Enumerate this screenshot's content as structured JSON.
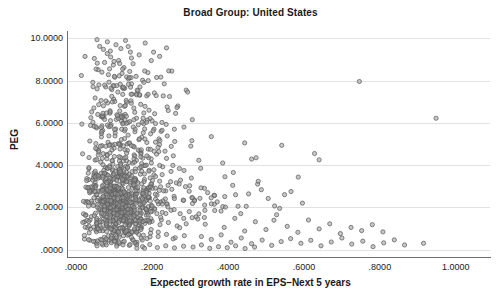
{
  "chart_data": {
    "type": "scatter",
    "title": "Broad Group: United States",
    "xlabel": "Expected growth rate in EPS–Next 5 years",
    "ylabel": "PEG",
    "xlim": [
      -0.024,
      1.09
    ],
    "ylim": [
      -0.35,
      10.35
    ],
    "xticks": [
      0.0,
      0.2,
      0.4,
      0.6,
      0.8,
      1.0
    ],
    "xtick_labels": [
      ".0000",
      ".2000",
      ".4000",
      ".6000",
      ".8000",
      "1.0000"
    ],
    "yticks": [
      0.0,
      2.0,
      4.0,
      6.0,
      8.0,
      10.0
    ],
    "ytick_labels": [
      ".0000",
      "2.0000",
      "4.0000",
      "6.0000",
      "8.0000",
      "10.0000"
    ],
    "grid": "horizontal",
    "legend": null,
    "marker": {
      "shape": "circle",
      "size": 4.2,
      "fill": "#9a9a9a",
      "edge": "#5d5d5d",
      "opacity": 0.55
    },
    "n_points": 1180,
    "points": [
      [
        0.055,
        9.94
      ],
      [
        0.062,
        9.62
      ],
      [
        0.072,
        9.48
      ],
      [
        0.105,
        9.7
      ],
      [
        0.118,
        9.52
      ],
      [
        0.13,
        9.9
      ],
      [
        0.082,
        9.28
      ],
      [
        0.091,
        9.12
      ],
      [
        0.143,
        9.35
      ],
      [
        0.166,
        9.22
      ],
      [
        0.048,
        9.05
      ],
      [
        0.075,
        8.86
      ],
      [
        0.098,
        8.74
      ],
      [
        0.112,
        8.95
      ],
      [
        0.126,
        8.62
      ],
      [
        0.15,
        8.8
      ],
      [
        0.058,
        8.52
      ],
      [
        0.068,
        8.4
      ],
      [
        0.085,
        8.28
      ],
      [
        0.102,
        8.16
      ],
      [
        0.121,
        8.34
      ],
      [
        0.138,
        8.08
      ],
      [
        0.158,
        8.2
      ],
      [
        0.175,
        8.02
      ],
      [
        0.044,
        7.92
      ],
      [
        0.06,
        7.8
      ],
      [
        0.078,
        7.7
      ],
      [
        0.094,
        7.58
      ],
      [
        0.11,
        7.46
      ],
      [
        0.128,
        7.64
      ],
      [
        0.147,
        7.36
      ],
      [
        0.163,
        7.52
      ],
      [
        0.186,
        7.28
      ],
      [
        0.05,
        7.18
      ],
      [
        0.066,
        7.06
      ],
      [
        0.083,
        6.94
      ],
      [
        0.099,
        7.12
      ],
      [
        0.116,
        6.82
      ],
      [
        0.133,
        6.98
      ],
      [
        0.152,
        6.7
      ],
      [
        0.17,
        6.88
      ],
      [
        0.192,
        6.6
      ],
      [
        0.041,
        6.52
      ],
      [
        0.057,
        6.4
      ],
      [
        0.073,
        6.28
      ],
      [
        0.089,
        6.46
      ],
      [
        0.106,
        6.16
      ],
      [
        0.123,
        6.34
      ],
      [
        0.141,
        6.06
      ],
      [
        0.159,
        6.22
      ],
      [
        0.178,
        5.96
      ],
      [
        0.2,
        6.1
      ],
      [
        0.226,
        6.02
      ],
      [
        0.038,
        5.88
      ],
      [
        0.054,
        5.76
      ],
      [
        0.07,
        5.64
      ],
      [
        0.086,
        5.82
      ],
      [
        0.103,
        5.52
      ],
      [
        0.12,
        5.7
      ],
      [
        0.137,
        5.42
      ],
      [
        0.155,
        5.58
      ],
      [
        0.173,
        5.32
      ],
      [
        0.196,
        5.48
      ],
      [
        0.218,
        5.24
      ],
      [
        0.24,
        5.38
      ],
      [
        0.036,
        5.14
      ],
      [
        0.052,
        5.02
      ],
      [
        0.068,
        4.92
      ],
      [
        0.084,
        5.08
      ],
      [
        0.1,
        4.8
      ],
      [
        0.117,
        4.96
      ],
      [
        0.135,
        4.7
      ],
      [
        0.153,
        4.86
      ],
      [
        0.171,
        4.6
      ],
      [
        0.19,
        4.76
      ],
      [
        0.212,
        4.52
      ],
      [
        0.234,
        4.66
      ],
      [
        0.256,
        4.44
      ],
      [
        0.034,
        4.36
      ],
      [
        0.05,
        4.24
      ],
      [
        0.065,
        4.14
      ],
      [
        0.081,
        4.3
      ],
      [
        0.097,
        4.04
      ],
      [
        0.114,
        4.2
      ],
      [
        0.131,
        3.94
      ],
      [
        0.149,
        4.1
      ],
      [
        0.167,
        3.86
      ],
      [
        0.185,
        4.0
      ],
      [
        0.205,
        3.78
      ],
      [
        0.228,
        3.92
      ],
      [
        0.25,
        3.7
      ],
      [
        0.272,
        3.84
      ],
      [
        0.032,
        3.62
      ],
      [
        0.047,
        3.52
      ],
      [
        0.062,
        3.42
      ],
      [
        0.078,
        3.58
      ],
      [
        0.094,
        3.34
      ],
      [
        0.11,
        3.48
      ],
      [
        0.127,
        3.26
      ],
      [
        0.144,
        3.4
      ],
      [
        0.162,
        3.18
      ],
      [
        0.18,
        3.32
      ],
      [
        0.199,
        3.1
      ],
      [
        0.22,
        3.24
      ],
      [
        0.242,
        3.04
      ],
      [
        0.264,
        3.16
      ],
      [
        0.288,
        2.98
      ],
      [
        0.03,
        2.92
      ],
      [
        0.044,
        2.84
      ],
      [
        0.059,
        2.76
      ],
      [
        0.074,
        2.88
      ],
      [
        0.09,
        2.68
      ],
      [
        0.106,
        2.8
      ],
      [
        0.122,
        2.6
      ],
      [
        0.139,
        2.72
      ],
      [
        0.156,
        2.54
      ],
      [
        0.174,
        2.66
      ],
      [
        0.193,
        2.46
      ],
      [
        0.213,
        2.58
      ],
      [
        0.235,
        2.4
      ],
      [
        0.258,
        2.52
      ],
      [
        0.282,
        2.34
      ],
      [
        0.305,
        2.46
      ],
      [
        0.028,
        2.28
      ],
      [
        0.042,
        2.2
      ],
      [
        0.056,
        2.12
      ],
      [
        0.071,
        2.24
      ],
      [
        0.086,
        2.04
      ],
      [
        0.102,
        2.16
      ],
      [
        0.118,
        1.96
      ],
      [
        0.134,
        2.08
      ],
      [
        0.151,
        1.9
      ],
      [
        0.168,
        2.0
      ],
      [
        0.186,
        1.82
      ],
      [
        0.206,
        1.94
      ],
      [
        0.227,
        1.76
      ],
      [
        0.25,
        1.86
      ],
      [
        0.274,
        1.7
      ],
      [
        0.298,
        1.8
      ],
      [
        0.026,
        1.64
      ],
      [
        0.04,
        1.56
      ],
      [
        0.054,
        1.48
      ],
      [
        0.068,
        1.6
      ],
      [
        0.083,
        1.42
      ],
      [
        0.098,
        1.52
      ],
      [
        0.114,
        1.36
      ],
      [
        0.13,
        1.46
      ],
      [
        0.146,
        1.3
      ],
      [
        0.163,
        1.4
      ],
      [
        0.181,
        1.24
      ],
      [
        0.2,
        1.34
      ],
      [
        0.221,
        1.18
      ],
      [
        0.243,
        1.28
      ],
      [
        0.266,
        1.12
      ],
      [
        0.29,
        1.22
      ],
      [
        0.024,
        1.06
      ],
      [
        0.038,
        0.98
      ],
      [
        0.052,
        0.92
      ],
      [
        0.066,
        1.02
      ],
      [
        0.08,
        0.86
      ],
      [
        0.095,
        0.96
      ],
      [
        0.11,
        0.8
      ],
      [
        0.126,
        0.9
      ],
      [
        0.142,
        0.74
      ],
      [
        0.159,
        0.84
      ],
      [
        0.177,
        0.68
      ],
      [
        0.196,
        0.78
      ],
      [
        0.216,
        0.62
      ],
      [
        0.238,
        0.72
      ],
      [
        0.261,
        0.56
      ],
      [
        0.285,
        0.66
      ],
      [
        0.022,
        0.5
      ],
      [
        0.036,
        0.44
      ],
      [
        0.05,
        0.38
      ],
      [
        0.064,
        0.48
      ],
      [
        0.078,
        0.32
      ],
      [
        0.093,
        0.42
      ],
      [
        0.108,
        0.26
      ],
      [
        0.124,
        0.36
      ],
      [
        0.14,
        0.2
      ],
      [
        0.157,
        0.3
      ],
      [
        0.175,
        0.14
      ],
      [
        0.194,
        0.24
      ],
      [
        0.214,
        0.1
      ],
      [
        0.236,
        0.18
      ],
      [
        0.259,
        0.08
      ],
      [
        0.283,
        0.16
      ],
      [
        0.308,
        0.12
      ],
      [
        0.33,
        0.22
      ],
      [
        0.352,
        0.06
      ],
      [
        0.375,
        0.14
      ],
      [
        0.398,
        0.09
      ],
      [
        0.42,
        0.18
      ],
      [
        0.445,
        0.05
      ],
      [
        0.47,
        0.12
      ],
      [
        0.33,
        0.62
      ],
      [
        0.356,
        0.48
      ],
      [
        0.382,
        0.7
      ],
      [
        0.408,
        0.35
      ],
      [
        0.435,
        0.55
      ],
      [
        0.462,
        0.28
      ],
      [
        0.49,
        0.45
      ],
      [
        0.515,
        0.2
      ],
      [
        0.54,
        0.38
      ],
      [
        0.565,
        0.52
      ],
      [
        0.592,
        0.3
      ],
      [
        0.618,
        0.44
      ],
      [
        0.645,
        0.18
      ],
      [
        0.672,
        0.36
      ],
      [
        0.7,
        0.55
      ],
      [
        0.726,
        0.26
      ],
      [
        0.755,
        0.4
      ],
      [
        0.782,
        0.14
      ],
      [
        0.81,
        0.32
      ],
      [
        0.838,
        0.46
      ],
      [
        0.865,
        0.22
      ],
      [
        0.915,
        0.3
      ],
      [
        0.316,
        1.55
      ],
      [
        0.34,
        1.2
      ],
      [
        0.365,
        1.85
      ],
      [
        0.39,
        1.05
      ],
      [
        0.418,
        1.48
      ],
      [
        0.444,
        0.88
      ],
      [
        0.472,
        1.32
      ],
      [
        0.5,
        0.95
      ],
      [
        0.528,
        1.65
      ],
      [
        0.556,
        1.1
      ],
      [
        0.584,
        0.82
      ],
      [
        0.612,
        1.4
      ],
      [
        0.64,
        0.98
      ],
      [
        0.668,
        1.22
      ],
      [
        0.696,
        0.76
      ],
      [
        0.724,
        1.05
      ],
      [
        0.752,
        0.9
      ],
      [
        0.78,
        1.18
      ],
      [
        0.808,
        0.84
      ],
      [
        0.312,
        2.35
      ],
      [
        0.338,
        2.9
      ],
      [
        0.364,
        2.15
      ],
      [
        0.392,
        3.45
      ],
      [
        0.42,
        2.6
      ],
      [
        0.448,
        2.05
      ],
      [
        0.478,
        3.1
      ],
      [
        0.506,
        2.42
      ],
      [
        0.536,
        1.95
      ],
      [
        0.566,
        2.75
      ],
      [
        0.596,
        2.2
      ],
      [
        0.628,
        4.55
      ],
      [
        0.64,
        4.25
      ],
      [
        0.746,
        7.96
      ],
      [
        0.948,
        6.22
      ],
      [
        0.302,
        4.9
      ],
      [
        0.328,
        3.85
      ],
      [
        0.356,
        5.35
      ],
      [
        0.386,
        4.1
      ],
      [
        0.414,
        3.65
      ],
      [
        0.444,
        5.05
      ],
      [
        0.474,
        4.35
      ],
      [
        0.262,
        6.45
      ],
      [
        0.284,
        5.8
      ],
      [
        0.306,
        6.15
      ],
      [
        0.246,
        7.25
      ],
      [
        0.268,
        6.8
      ],
      [
        0.29,
        7.55
      ],
      [
        0.212,
        8.15
      ],
      [
        0.232,
        7.85
      ],
      [
        0.252,
        8.45
      ],
      [
        0.198,
        8.95
      ],
      [
        0.22,
        9.15
      ],
      [
        0.238,
        9.55
      ],
      [
        0.182,
        9.78
      ],
      [
        0.204,
        9.35
      ]
    ]
  }
}
